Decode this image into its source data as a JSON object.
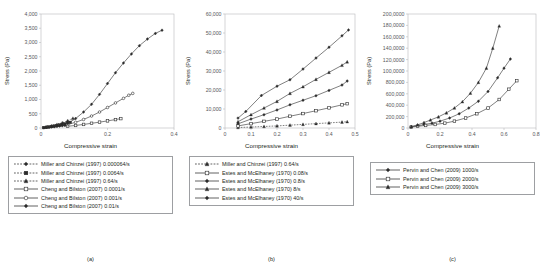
{
  "figure": {
    "panels": [
      {
        "caption": "(a)",
        "xlabel": "Compressive strain",
        "ylabel": "Stress (Pa)",
        "yticks": [
          "0",
          "500",
          "1,000",
          "1,500",
          "2,000",
          "2,500",
          "3,000",
          "3,500",
          "4,000"
        ],
        "xticks": [
          "0",
          "0.2",
          "0.4"
        ],
        "legend": [
          {
            "label": "Miller and Chinzei (1997) 0.000064/s",
            "style": "dashed",
            "marker": "diamond-filled"
          },
          {
            "label": "Miller and Chinzei (1997) 0.0064/s",
            "style": "dashed",
            "marker": "square-filled"
          },
          {
            "label": "Miller and Chinzei (1997) 0.64/s",
            "style": "dashed",
            "marker": "triangle-filled"
          },
          {
            "label": "Cheng and Bilston (2007) 0.0001/s",
            "style": "solid",
            "marker": "square-open"
          },
          {
            "label": "Cheng and Bilston (2007) 0.001/s",
            "style": "solid",
            "marker": "circle-open"
          },
          {
            "label": "Cheng and Bilston (2007) 0.01/s",
            "style": "solid",
            "marker": "diamond-filled"
          }
        ]
      },
      {
        "caption": "(b)",
        "xlabel": "Compressive strain",
        "ylabel": "Stress (Pa)",
        "yticks": [
          "0",
          "10,000",
          "20,000",
          "30,000",
          "40,000",
          "50,000",
          "60,000"
        ],
        "xticks": [
          "0",
          "0.1",
          "0.2",
          "0.3",
          "0.4",
          "0.5"
        ],
        "legend": [
          {
            "label": "Miller and Chinzei (1997) 0.64/s",
            "style": "dashed",
            "marker": "triangle-filled"
          },
          {
            "label": "Estes and McElhaney (1970) 0.08/s",
            "style": "solid",
            "marker": "square-open"
          },
          {
            "label": "Estes and McElhaney (1970) 0.8/s",
            "style": "solid",
            "marker": "diamond-filled"
          },
          {
            "label": "Estes and McElhaney (1970) 8/s",
            "style": "solid",
            "marker": "triangle-filled"
          },
          {
            "label": "Estes and McElhaney (1970) 40/s",
            "style": "solid",
            "marker": "diamond-filled"
          }
        ]
      },
      {
        "caption": "(c)",
        "xlabel": "Compressive strain",
        "ylabel": "Stress (Pa)",
        "yticks": [
          "0",
          "200,000",
          "400,000",
          "600,000",
          "800,000",
          "100,0000",
          "120,0000",
          "140,0000",
          "160,0000",
          "180,0000",
          "200,0000"
        ],
        "xticks": [
          "0",
          "0.2",
          "0.4",
          "0.6",
          "0.8"
        ],
        "legend": [
          {
            "label": "Pervin and Chen (2009) 1000/s",
            "style": "solid",
            "marker": "diamond-filled"
          },
          {
            "label": "Pervin and Chen (2009) 2000/s",
            "style": "solid",
            "marker": "square-open"
          },
          {
            "label": "Pervin and Chen (2009) 3000/s",
            "style": "solid",
            "marker": "triangle-filled"
          }
        ]
      }
    ]
  },
  "chart_data": [
    {
      "type": "line",
      "panel": "(a)",
      "title": "",
      "xlabel": "Compressive strain",
      "ylabel": "Stress (Pa)",
      "xlim": [
        0,
        0.5
      ],
      "ylim": [
        0,
        4000
      ],
      "grid": false,
      "legend_position": "below",
      "series": [
        {
          "name": "Miller and Chinzei (1997) 0.000064/s",
          "style": "dashed",
          "marker": "diamond-filled",
          "x": [
            0.01,
            0.02,
            0.03,
            0.04,
            0.05,
            0.06,
            0.07,
            0.08,
            0.09,
            0.1
          ],
          "y": [
            10,
            18,
            26,
            35,
            45,
            55,
            66,
            78,
            90,
            105
          ]
        },
        {
          "name": "Miller and Chinzei (1997) 0.0064/s",
          "style": "dashed",
          "marker": "square-filled",
          "x": [
            0.01,
            0.02,
            0.03,
            0.04,
            0.05,
            0.06,
            0.07,
            0.08,
            0.09,
            0.1,
            0.11
          ],
          "y": [
            14,
            26,
            40,
            55,
            70,
            88,
            106,
            126,
            148,
            172,
            198
          ]
        },
        {
          "name": "Miller and Chinzei (1997) 0.64/s",
          "style": "dashed",
          "marker": "triangle-filled",
          "x": [
            0.02,
            0.04,
            0.06,
            0.08,
            0.1,
            0.12
          ],
          "y": [
            35,
            75,
            125,
            185,
            255,
            340
          ]
        },
        {
          "name": "Cheng and Bilston (2007) 0.0001/s",
          "style": "solid",
          "marker": "square-open",
          "x": [
            0.1,
            0.13,
            0.16,
            0.19,
            0.22,
            0.25,
            0.28,
            0.3
          ],
          "y": [
            60,
            90,
            125,
            165,
            205,
            250,
            295,
            330
          ]
        },
        {
          "name": "Cheng and Bilston (2007) 0.001/s",
          "style": "solid",
          "marker": "circle-open",
          "x": [
            0.1,
            0.13,
            0.16,
            0.19,
            0.22,
            0.25,
            0.28,
            0.31,
            0.33,
            0.345
          ],
          "y": [
            120,
            200,
            300,
            420,
            560,
            720,
            880,
            1040,
            1150,
            1215
          ]
        },
        {
          "name": "Cheng and Bilston (2007) 0.01/s",
          "style": "solid",
          "marker": "diamond-filled",
          "x": [
            0.1,
            0.13,
            0.16,
            0.19,
            0.22,
            0.25,
            0.28,
            0.31,
            0.34,
            0.37,
            0.4,
            0.43,
            0.455
          ],
          "y": [
            160,
            330,
            560,
            830,
            1180,
            1560,
            1940,
            2280,
            2600,
            2890,
            3120,
            3320,
            3430
          ]
        }
      ]
    },
    {
      "type": "line",
      "panel": "(b)",
      "title": "",
      "xlabel": "Compressive strain",
      "ylabel": "Stress (Pa)",
      "xlim": [
        0,
        0.5
      ],
      "ylim": [
        0,
        60000
      ],
      "grid": false,
      "legend_position": "below",
      "series": [
        {
          "name": "Miller and Chinzei (1997) 0.64/s",
          "style": "dashed",
          "marker": "triangle-filled",
          "x": [
            0.05,
            0.1,
            0.15,
            0.2,
            0.25,
            0.3,
            0.35,
            0.4,
            0.45,
            0.47
          ],
          "y": [
            250,
            500,
            800,
            1100,
            1500,
            1900,
            2300,
            2700,
            3100,
            3300
          ]
        },
        {
          "name": "Estes and McElhaney (1970) 0.08/s",
          "style": "solid",
          "marker": "square-open",
          "x": [
            0.05,
            0.1,
            0.15,
            0.2,
            0.25,
            0.3,
            0.35,
            0.4,
            0.45,
            0.47
          ],
          "y": [
            1100,
            2300,
            3500,
            4700,
            6200,
            7600,
            9100,
            10600,
            12200,
            12800
          ]
        },
        {
          "name": "Estes and McElhaney (1970) 0.8/s",
          "style": "solid",
          "marker": "diamond-filled",
          "x": [
            0.05,
            0.1,
            0.15,
            0.2,
            0.25,
            0.3,
            0.35,
            0.4,
            0.45,
            0.47
          ],
          "y": [
            2200,
            4700,
            7000,
            9500,
            12200,
            14600,
            17000,
            19800,
            22600,
            24700
          ]
        },
        {
          "name": "Estes and McElhaney (1970) 8/s",
          "style": "solid",
          "marker": "triangle-filled",
          "x": [
            0.05,
            0.1,
            0.15,
            0.2,
            0.25,
            0.3,
            0.35,
            0.4,
            0.45,
            0.47
          ],
          "y": [
            3300,
            7000,
            10500,
            14000,
            18200,
            21700,
            25600,
            29300,
            33000,
            34800
          ]
        },
        {
          "name": "Estes and McElhaney (1970) 40/s",
          "style": "solid",
          "marker": "diamond-filled",
          "x": [
            0.05,
            0.08,
            0.14,
            0.2,
            0.25,
            0.3,
            0.35,
            0.4,
            0.45,
            0.475
          ],
          "y": [
            5200,
            8700,
            17100,
            22000,
            25400,
            31000,
            36800,
            42500,
            48500,
            51600
          ]
        }
      ]
    },
    {
      "type": "line",
      "panel": "(c)",
      "title": "",
      "xlabel": "Compressive strain",
      "ylabel": "Stress (Pa)",
      "xlim": [
        0,
        0.8
      ],
      "ylim": [
        0,
        2000000
      ],
      "grid": false,
      "legend_position": "below",
      "series": [
        {
          "name": "Pervin and Chen (2009) 1000/s",
          "style": "solid",
          "marker": "diamond-filled",
          "x": [
            0.02,
            0.06,
            0.1,
            0.15,
            0.2,
            0.26,
            0.32,
            0.38,
            0.44,
            0.5,
            0.56,
            0.6,
            0.64
          ],
          "y": [
            20000,
            40000,
            60000,
            85000,
            120000,
            175000,
            250000,
            350000,
            470000,
            640000,
            880000,
            1050000,
            1210000
          ]
        },
        {
          "name": "Pervin and Chen (2009) 2000/s",
          "style": "solid",
          "marker": "square-open",
          "x": [
            0.02,
            0.06,
            0.11,
            0.17,
            0.23,
            0.29,
            0.36,
            0.43,
            0.5,
            0.57,
            0.63,
            0.68
          ],
          "y": [
            15000,
            30000,
            45000,
            62000,
            85000,
            120000,
            175000,
            250000,
            350000,
            500000,
            680000,
            830000
          ]
        },
        {
          "name": "Pervin and Chen (2009) 3000/s",
          "style": "solid",
          "marker": "triangle-filled",
          "x": [
            0.02,
            0.06,
            0.1,
            0.14,
            0.19,
            0.24,
            0.29,
            0.34,
            0.39,
            0.44,
            0.49,
            0.53,
            0.57
          ],
          "y": [
            25000,
            55000,
            95000,
            140000,
            195000,
            265000,
            350000,
            460000,
            610000,
            800000,
            1050000,
            1400000,
            1790000
          ]
        }
      ]
    }
  ]
}
